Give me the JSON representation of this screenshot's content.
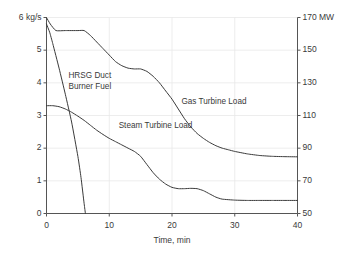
{
  "chart_data": {
    "type": "line",
    "title": "",
    "xlabel": "Time, min",
    "ylabel_left": "6 kg/s",
    "ylabel_right": "170 MW",
    "xlim": [
      0,
      40
    ],
    "ylim_left": [
      0,
      6
    ],
    "ylim_right": [
      50,
      170
    ],
    "grid": true,
    "legend_position": "inline-annotations",
    "x_ticks": [
      "0",
      "10",
      "20",
      "30",
      "40"
    ],
    "x_tick_values": [
      0,
      10,
      20,
      30,
      40
    ],
    "y_ticks_left": [
      "6 kg/s",
      "5",
      "4",
      "3",
      "2",
      "1",
      "0"
    ],
    "y_tick_values_left": [
      6,
      5,
      4,
      3,
      2,
      1,
      0
    ],
    "y_ticks_right": [
      "170 MW",
      "150",
      "130",
      "110",
      "90",
      "70",
      "50"
    ],
    "y_tick_values_right": [
      170,
      150,
      130,
      110,
      90,
      70,
      50
    ],
    "series": [
      {
        "name": "HRSG Duct Burner Fuel",
        "axis": "left",
        "units": "kg/s",
        "x": [
          0,
          0.5,
          1,
          2,
          3,
          4,
          5,
          5.5,
          6,
          6.2
        ],
        "values": [
          5.8,
          5.55,
          5.2,
          4.45,
          3.65,
          2.8,
          1.75,
          1.1,
          0.3,
          0.0
        ]
      },
      {
        "name": "Gas Turbine Load",
        "axis": "right",
        "units": "MW",
        "x": [
          0,
          0.6,
          1.5,
          3,
          5,
          6,
          7,
          8,
          9,
          10,
          11,
          12,
          13,
          14,
          15,
          16,
          17,
          18,
          19,
          20,
          21,
          22,
          23,
          24,
          25,
          26,
          27,
          28,
          29,
          30,
          32,
          34,
          36,
          38,
          40
        ],
        "values": [
          170,
          166,
          162,
          162,
          162,
          162,
          159,
          155,
          151,
          147,
          143,
          140.5,
          139,
          138.5,
          138.5,
          137,
          134,
          130,
          125,
          120,
          114,
          108,
          103,
          99,
          96,
          93.5,
          91.5,
          90,
          89,
          88,
          86.5,
          85.5,
          85,
          84.8,
          84.7
        ]
      },
      {
        "name": "Steam Turbine Load",
        "axis": "left",
        "units": "kg/s",
        "x": [
          0,
          1,
          2,
          3,
          4,
          5,
          6,
          7,
          8,
          9,
          10,
          11,
          12,
          13,
          14,
          15,
          16,
          17,
          18,
          19,
          20,
          21,
          22,
          23,
          24,
          25,
          26,
          27,
          28,
          30,
          32,
          34,
          36,
          38,
          40
        ],
        "values": [
          3.3,
          3.3,
          3.27,
          3.2,
          3.1,
          2.98,
          2.85,
          2.7,
          2.55,
          2.42,
          2.3,
          2.2,
          2.1,
          2.0,
          1.9,
          1.75,
          1.5,
          1.25,
          1.05,
          0.9,
          0.8,
          0.76,
          0.76,
          0.77,
          0.76,
          0.7,
          0.6,
          0.5,
          0.44,
          0.41,
          0.4,
          0.4,
          0.4,
          0.4,
          0.4
        ]
      }
    ],
    "annotations": [
      {
        "text_line1": "HRSG Duct",
        "text_line2": "Burner Fuel",
        "x": 3.5,
        "y_left": 4.2
      },
      {
        "text_line1": "Gas Turbine Load",
        "text_line2": "",
        "x": 21.5,
        "y_left": 3.45
      },
      {
        "text_line1": "Steam Turbine Load",
        "text_line2": "",
        "x": 11.5,
        "y_left": 2.72
      }
    ],
    "colors": {
      "line": "#3a3a3a",
      "axis": "#555555",
      "grid": "#e8e8e8",
      "background": "#ffffff",
      "text": "#3a3a3a"
    }
  }
}
